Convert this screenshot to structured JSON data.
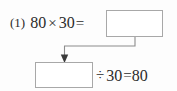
{
  "problem": {
    "number_label": "(1)",
    "row1": {
      "left_operand": "80",
      "operator": "×",
      "right_operand": "30",
      "equals": "=",
      "answer_box_value": ""
    },
    "row2": {
      "answer_box_value": "",
      "operator": "÷",
      "right_operand": "30",
      "equals": "=",
      "result": "80"
    },
    "connector": {
      "name": "arrow-down-left",
      "description": "arrow from product box to dividend box"
    }
  },
  "colors": {
    "text": "#2b2b2b",
    "box_border": "#a8a8a8",
    "connector": "#8c8c8c",
    "background": "#fdfdfd"
  }
}
